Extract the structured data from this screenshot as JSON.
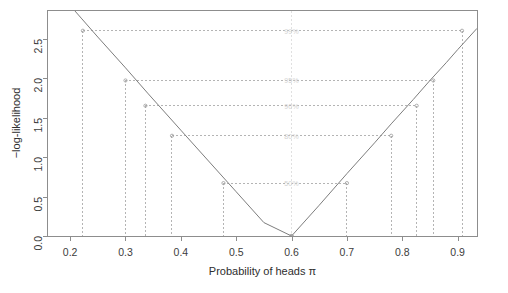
{
  "chart_data": {
    "type": "line",
    "title": "",
    "xlabel": "Probability of heads π",
    "ylabel": "−log-likelihood",
    "xlim": [
      0.16,
      0.935
    ],
    "ylim": [
      0.0,
      2.85
    ],
    "xticks": [
      0.2,
      0.3,
      0.4,
      0.5,
      0.6,
      0.7,
      0.8,
      0.9
    ],
    "xticklabels": [
      "0.2",
      "0.3",
      "0.4",
      "0.5",
      "0.6",
      "0.7",
      "0.8",
      "0.9"
    ],
    "yticks": [
      0.0,
      0.5,
      1.0,
      1.5,
      2.0,
      2.5
    ],
    "yticklabels": [
      "0.0",
      "0.5",
      "1.0",
      "1.5",
      "2.0",
      "2.5"
    ],
    "grid": false,
    "legend": null,
    "series": [
      {
        "name": "−log-likelihood",
        "color": "#7d7d7d",
        "mle": 0.6,
        "x": [
          0.16,
          0.2,
          0.22,
          0.25,
          0.3,
          0.34,
          0.4,
          0.45,
          0.5,
          0.55,
          0.6,
          0.65,
          0.7,
          0.75,
          0.78,
          0.82,
          0.85,
          0.88,
          0.9,
          0.935
        ],
        "y": [
          3.24,
          2.92,
          2.76,
          2.52,
          2.13,
          1.81,
          1.34,
          0.95,
          0.56,
          0.17,
          0.0,
          0.39,
          0.79,
          1.18,
          1.42,
          1.73,
          1.97,
          2.2,
          2.36,
          2.63
        ]
      }
    ],
    "guides": {
      "note": "horizontal dashed levels with paired vertical dashed drops to the baseline",
      "levels": [
        2.6,
        1.97,
        1.65,
        1.27,
        0.67,
        0.0
      ],
      "level_labels": [
        "99%",
        "95%",
        "90%",
        "80%",
        "50%",
        ""
      ],
      "intervals": [
        {
          "level": 2.6,
          "lower": 0.223,
          "upper": 0.908
        },
        {
          "level": 1.97,
          "lower": 0.3,
          "upper": 0.856
        },
        {
          "level": 1.65,
          "lower": 0.336,
          "upper": 0.826
        },
        {
          "level": 1.27,
          "lower": 0.384,
          "upper": 0.78
        },
        {
          "level": 0.67,
          "lower": 0.477,
          "upper": 0.7
        },
        {
          "level": 0.0,
          "lower": 0.6,
          "upper": 0.6
        }
      ]
    },
    "style": {
      "curve_color": "#7d7d7d",
      "frame_color": "#8d8d8d",
      "dash_color": "#b4b4b4",
      "annotation_color": "#d2d2d2",
      "background": "#ffffff"
    }
  }
}
